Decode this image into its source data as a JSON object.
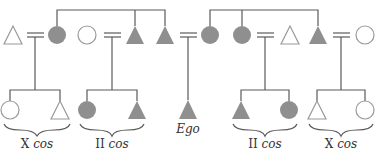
{
  "diagram": {
    "type": "kinship-chart",
    "colors": {
      "filled": "#8f8f8f",
      "line": "#5a5a5a",
      "outline": "#9a9a9a"
    },
    "labels": [
      {
        "id": "cross-cousins-left",
        "prefix": "X",
        "suffix": "cos",
        "x": 37
      },
      {
        "id": "parallel-cousins-left",
        "prefix": "II",
        "suffix": "cos",
        "x": 112
      },
      {
        "id": "ego",
        "prefix": "",
        "suffix": "Ego",
        "x": 188
      },
      {
        "id": "parallel-cousins-right",
        "prefix": "II",
        "suffix": "cos",
        "x": 265
      },
      {
        "id": "cross-cousins-right",
        "prefix": "X",
        "suffix": "cos",
        "x": 341
      }
    ],
    "top_row": [
      {
        "shape": "triangle",
        "filled": false,
        "x": 13
      },
      {
        "shape": "circle",
        "filled": true,
        "x": 57
      },
      {
        "shape": "circle",
        "filled": false,
        "x": 87
      },
      {
        "shape": "triangle",
        "filled": true,
        "x": 135
      },
      {
        "shape": "triangle",
        "filled": true,
        "x": 165
      },
      {
        "shape": "circle",
        "filled": true,
        "x": 210
      },
      {
        "shape": "circle",
        "filled": true,
        "x": 242
      },
      {
        "shape": "triangle",
        "filled": false,
        "x": 290
      },
      {
        "shape": "triangle",
        "filled": true,
        "x": 318
      },
      {
        "shape": "circle",
        "filled": false,
        "x": 365
      }
    ],
    "bottom_row": [
      {
        "shape": "circle",
        "filled": false,
        "x": 10
      },
      {
        "shape": "triangle",
        "filled": false,
        "x": 60
      },
      {
        "shape": "circle",
        "filled": true,
        "x": 87
      },
      {
        "shape": "triangle",
        "filled": true,
        "x": 137
      },
      {
        "shape": "triangle",
        "filled": true,
        "x": 188,
        "ego": true
      },
      {
        "shape": "triangle",
        "filled": true,
        "x": 241
      },
      {
        "shape": "circle",
        "filled": true,
        "x": 289
      },
      {
        "shape": "triangle",
        "filled": false,
        "x": 317
      },
      {
        "shape": "circle",
        "filled": false,
        "x": 365
      }
    ]
  }
}
